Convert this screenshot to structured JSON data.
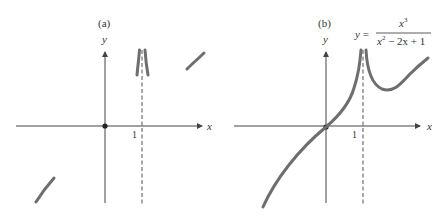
{
  "panels": [
    {
      "id": "a",
      "label": "(a)",
      "y_axis_label": "y",
      "x_axis_label": "x",
      "tick_label": "1",
      "description": "Sketch: vertical asymptote at x = 1, curve pieces near asymptote and at extremes, point at origin"
    },
    {
      "id": "b",
      "label": "(b)",
      "y_axis_label": "y",
      "x_axis_label": "x",
      "tick_label": "1",
      "equation": {
        "lhs": "y =",
        "numerator": "x",
        "numerator_exp": "3",
        "denominator_x": "x",
        "denominator_exp": "2",
        "denominator_rest": " − 2x + 1"
      },
      "description": "Full graph of y = x^3/(x^2 - 2x + 1) with vertical asymptote x = 1"
    }
  ],
  "colors": {
    "curve": "#6e6e6e",
    "axis": "#444444",
    "text": "#333333"
  }
}
